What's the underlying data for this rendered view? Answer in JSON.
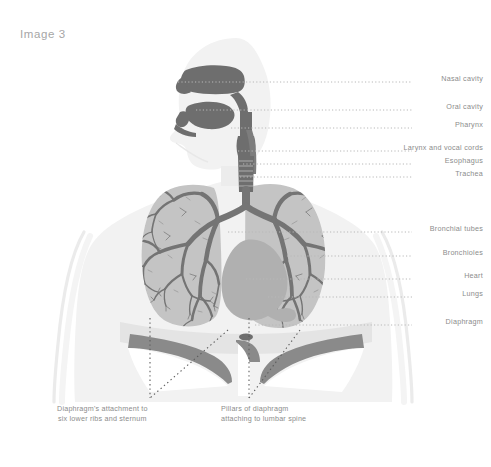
{
  "figure": {
    "image_caption": "Image 3",
    "background_color": "#ffffff",
    "body_silhouette_color": "#f2f2f2",
    "lung_color": "#c4c4c4",
    "airway_color": "#6e6e6e",
    "bronchial_tree_color": "#757575",
    "heart_color": "#b0b0b0",
    "diaphragm_color": "#8a8a8a",
    "label_color": "#8c8c8c",
    "leader_color": "#b8b8b8"
  },
  "annotations": [
    {
      "id": "nasal-cavity",
      "label": "Nasal cavity",
      "label_y": 79,
      "leader_y": 82,
      "leader_x_start": 178,
      "leader_x_end": 412
    },
    {
      "id": "oral-cavity",
      "label": "Oral cavity",
      "label_y": 107,
      "leader_y": 110,
      "leader_x_start": 196,
      "leader_x_end": 412
    },
    {
      "id": "pharynx",
      "label": "Pharynx",
      "label_y": 125,
      "leader_y": 128,
      "leader_x_start": 231,
      "leader_x_end": 412
    },
    {
      "id": "larynx-and-vocal-cords",
      "label": "Larynx and vocal cords",
      "label_y": 148,
      "leader_y": 151,
      "leader_x_start": 238,
      "leader_x_end": 412
    },
    {
      "id": "esophagus",
      "label": "Esophagus",
      "label_y": 161,
      "leader_y": 164,
      "leader_x_start": 243,
      "leader_x_end": 412
    },
    {
      "id": "trachea",
      "label": "Trachea",
      "label_y": 174,
      "leader_y": 177,
      "leader_x_start": 240,
      "leader_x_end": 412
    },
    {
      "id": "bronchial-tubes",
      "label": "Bronchial tubes",
      "label_y": 229,
      "leader_y": 232,
      "leader_x_start": 228,
      "leader_x_end": 412
    },
    {
      "id": "bronchioles",
      "label": "Bronchioles",
      "label_y": 253,
      "leader_y": 256,
      "leader_x_start": 287,
      "leader_x_end": 412
    },
    {
      "id": "heart",
      "label": "Heart",
      "label_y": 276,
      "leader_y": 279,
      "leader_x_start": 246,
      "leader_x_end": 412
    },
    {
      "id": "lungs",
      "label": "Lungs",
      "label_y": 294,
      "leader_y": 297,
      "leader_x_start": 268,
      "leader_x_end": 412
    },
    {
      "id": "diaphragm",
      "label": "Diaphragm",
      "label_y": 322,
      "leader_y": 325,
      "leader_x_start": 255,
      "leader_x_end": 412
    }
  ],
  "bottom_callouts": [
    {
      "id": "diaphragm-attachment",
      "line1": "Diaphragm's attachment to",
      "line2": "six lower ribs and sternum"
    },
    {
      "id": "pillars-of-diaphragm",
      "line1": "Pillars of diaphragm",
      "line2": "attaching to lumbar spine"
    }
  ]
}
